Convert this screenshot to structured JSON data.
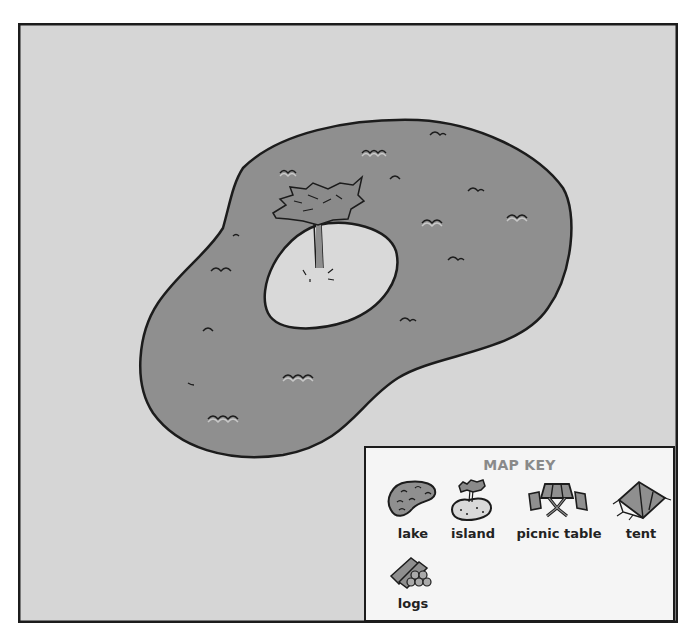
{
  "map": {
    "background_color": "#d6d6d6",
    "lake_color": "#8f8f8f",
    "island_color": "#d9d9d9",
    "outline_color": "#1c1c1c",
    "features": [
      {
        "type": "lake",
        "name": "lake"
      },
      {
        "type": "island",
        "name": "island"
      },
      {
        "type": "tree",
        "location": "island"
      }
    ]
  },
  "key": {
    "title": "MAP KEY",
    "title_color": "#8a8a8a",
    "items": [
      {
        "label": "lake",
        "icon": "lake-icon"
      },
      {
        "label": "island",
        "icon": "island-icon"
      },
      {
        "label": "picnic table",
        "icon": "picnic-table-icon"
      },
      {
        "label": "tent",
        "icon": "tent-icon"
      },
      {
        "label": "logs",
        "icon": "logs-icon"
      }
    ]
  }
}
